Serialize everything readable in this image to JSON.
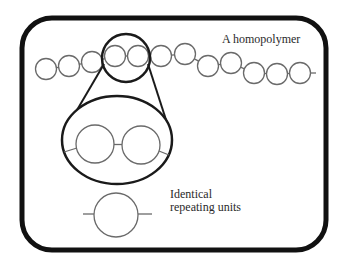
{
  "diagram": {
    "title": "A homopolymer",
    "units_label_line1": "Identical",
    "units_label_line2": "repeating units",
    "colors": {
      "frame": "#111111",
      "circle_stroke": "#6a6a6a",
      "magnifier": "#1a1a1a",
      "text": "#2a2a2a"
    },
    "frame": {
      "x": 22,
      "y": 18,
      "width": 304,
      "height": 232,
      "rx": 30,
      "stroke_width": 5
    },
    "chain": {
      "radius": 10.5,
      "units": [
        {
          "cx": 46,
          "cy": 69
        },
        {
          "cx": 69,
          "cy": 66
        },
        {
          "cx": 92,
          "cy": 62
        },
        {
          "cx": 115,
          "cy": 56
        },
        {
          "cx": 138,
          "cy": 56
        },
        {
          "cx": 161,
          "cy": 56
        },
        {
          "cx": 185,
          "cy": 54
        },
        {
          "cx": 208,
          "cy": 66
        },
        {
          "cx": 231,
          "cy": 63
        },
        {
          "cx": 254,
          "cy": 73
        },
        {
          "cx": 277,
          "cy": 74
        },
        {
          "cx": 300,
          "cy": 73
        }
      ],
      "tail_end_x": 316
    },
    "magnifier": {
      "small": {
        "cx": 126,
        "cy": 58,
        "r": 24
      },
      "large": {
        "cx": 117,
        "cy": 140,
        "rx": 55,
        "ry": 44
      },
      "zoomed_units": [
        {
          "cx": 95,
          "cy": 144,
          "r": 19
        },
        {
          "cx": 141,
          "cy": 145,
          "r": 19
        }
      ]
    },
    "single_unit": {
      "cx": 116,
      "cy": 215,
      "r": 22,
      "stub_left": 83,
      "stub_right": 152
    }
  }
}
